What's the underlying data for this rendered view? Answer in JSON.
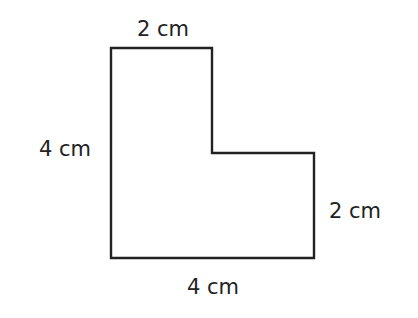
{
  "diagram": {
    "type": "compound-rectilinear-shape",
    "shape_name": "L-shape",
    "units": "cm",
    "stroke_color": "#222222",
    "background_color": "#ffffff",
    "vertices_px": [
      [
        111,
        48
      ],
      [
        212,
        48
      ],
      [
        212,
        153
      ],
      [
        314,
        153
      ],
      [
        314,
        258
      ],
      [
        111,
        258
      ]
    ],
    "labels": {
      "top": "2 cm",
      "left": "4 cm",
      "right": "2 cm",
      "bottom": "4 cm"
    }
  }
}
